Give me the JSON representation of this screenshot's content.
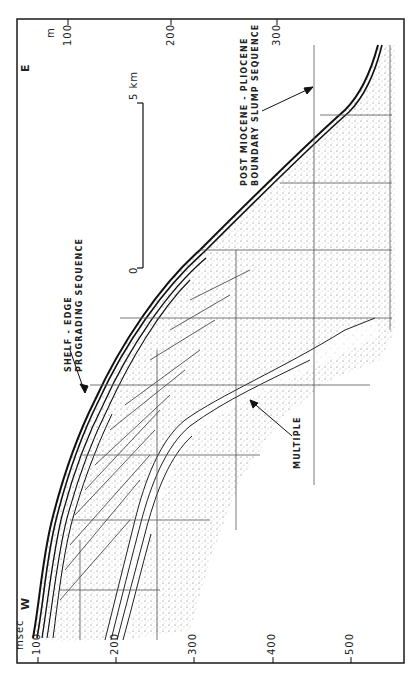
{
  "figure": {
    "directions": {
      "west": "W",
      "east": "E"
    },
    "axes": {
      "time_axis": {
        "unit_label": "msec",
        "ticks": [
          "100",
          "200",
          "300",
          "400",
          "500"
        ]
      },
      "depth_axis": {
        "unit_label": "m",
        "ticks": [
          "100",
          "200",
          "300"
        ]
      }
    },
    "scale_bar": {
      "start_label": "0",
      "end_label": "5 km"
    },
    "annotations": {
      "shelf_edge": {
        "line1": "SHELF - EDGE",
        "line2": "PROGRADING  SEQUENCE"
      },
      "slump": {
        "line1": "POST MIOCENE - PLIOCENE",
        "line2": "BOUNDARY SLUMP SEQUENCE"
      },
      "multiple": {
        "line1": "MULTIPLE"
      }
    },
    "colors": {
      "ink": "#1a1a1a",
      "paper": "#ffffff",
      "grid": "#555555"
    }
  }
}
